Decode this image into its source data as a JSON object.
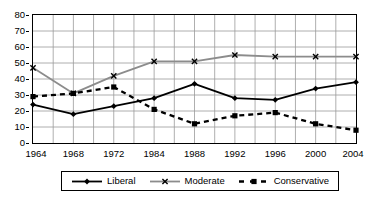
{
  "chart_data": {
    "type": "line",
    "title": "",
    "xlabel": "",
    "ylabel": "",
    "categories": [
      "1964",
      "1968",
      "1972",
      "1984",
      "1988",
      "1992",
      "1996",
      "2000",
      "2004"
    ],
    "ylim": [
      0,
      80
    ],
    "y_ticks": [
      0,
      10,
      20,
      30,
      40,
      50,
      60,
      70,
      80
    ],
    "grid": true,
    "legend_position": "bottom",
    "series": [
      {
        "name": "Liberal",
        "color": "#000000",
        "line_style": "solid",
        "marker": "diamond",
        "values": [
          24,
          18,
          23,
          28,
          37,
          28,
          27,
          34,
          38
        ]
      },
      {
        "name": "Moderate",
        "color": "#8c8c8c",
        "line_style": "solid",
        "marker": "x",
        "values": [
          47,
          31,
          42,
          51,
          51,
          55,
          54,
          54,
          54
        ]
      },
      {
        "name": "Conservative",
        "color": "#000000",
        "line_style": "dashed",
        "marker": "square",
        "values": [
          29,
          31,
          35,
          21,
          12,
          17,
          19,
          12,
          8
        ]
      }
    ]
  },
  "axis": {
    "y_tick_labels": [
      "80",
      "70",
      "60",
      "50",
      "40",
      "30",
      "20",
      "10",
      "0"
    ],
    "x_tick_labels": [
      "1964",
      "1968",
      "1972",
      "1984",
      "1988",
      "1992",
      "1996",
      "2000",
      "2004"
    ]
  },
  "legend": {
    "items": [
      {
        "label": "Liberal",
        "icon": "line-diamond-marker-icon"
      },
      {
        "label": "Moderate",
        "icon": "line-cross-marker-icon"
      },
      {
        "label": "Conservative",
        "icon": "dashed-line-square-marker-icon"
      }
    ]
  },
  "colors": {
    "liberal": "#000000",
    "moderate": "#8c8c8c",
    "conservative": "#000000",
    "grid": "#9a9a9a",
    "frame": "#000000",
    "background": "#ffffff"
  }
}
